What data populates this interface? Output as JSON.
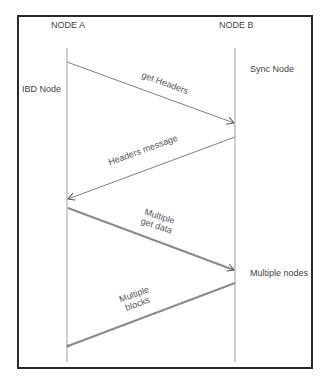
{
  "diagram": {
    "type": "sequence",
    "participants": [
      {
        "id": "A",
        "name": "NODE A",
        "role": "IBD Node"
      },
      {
        "id": "B",
        "name": "NODE B",
        "role": "Sync Node"
      }
    ],
    "side_labels": {
      "left": "IBD Node",
      "right_top": "Sync Node",
      "right_bottom": "Multiple nodes"
    },
    "messages": [
      {
        "from": "A",
        "to": "B",
        "label": "get Headers",
        "style": "thin"
      },
      {
        "from": "B",
        "to": "A",
        "label": "Headers message",
        "style": "thin"
      },
      {
        "from": "A",
        "to": "B",
        "label_line1": "Multiple",
        "label_line2": "get data",
        "style": "thick"
      },
      {
        "from": "B",
        "to": "A",
        "label_line1": "Multiple",
        "label_line2": "blocks",
        "style": "thick"
      }
    ],
    "colors": {
      "frame": "#2a2a2a",
      "lifeline": "#a0a0a0",
      "thin_arrow": "#707070",
      "thick_arrow": "#8a8a8a",
      "text": "#444444"
    }
  }
}
